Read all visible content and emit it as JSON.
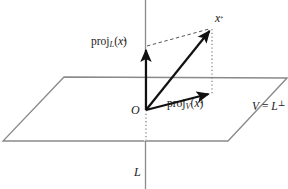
{
  "figure": {
    "width": 288,
    "height": 189,
    "background_color": "#ffffff"
  },
  "labels": {
    "proj_l": {
      "func": "proj",
      "subscript": "L",
      "open": "(",
      "arg": "x",
      "close": ")",
      "text": "proj_L(x⃗)"
    },
    "proj_v": {
      "func": "proj",
      "subscript": "V",
      "open": "(",
      "arg": "x",
      "close": ")",
      "text": "proj_V(x⃗)"
    },
    "x_vector": {
      "arg": "x",
      "text": "x⃗"
    },
    "origin": {
      "text": "O"
    },
    "line_l": {
      "text": "L"
    },
    "plane_v": {
      "lhs": "V",
      "eq": " = ",
      "base": "L",
      "superscript": "⊥",
      "text": "V = L⊥"
    }
  },
  "geometry": {
    "plane": {
      "name": "V = L perp",
      "corner_top_left": [
        64,
        77
      ],
      "corner_top_right": [
        287,
        78
      ],
      "corner_bottom_right": [
        228,
        141
      ],
      "corner_bottom_left": [
        3,
        141
      ],
      "stroke_color": "#8a8a8a",
      "stroke_width": 1.3
    },
    "axis_line_l": {
      "name": "L",
      "x": 145.5,
      "y_top": 0,
      "y_bottom": 189,
      "stroke_color": "#8a8a8a",
      "stroke_width": 1.3
    },
    "origin_point": [
      146,
      110
    ],
    "x_tip": [
      212,
      28
    ],
    "proj_l_tip": [
      146,
      46
    ],
    "proj_v_tip": [
      212,
      93
    ],
    "vectors": [
      {
        "name": "x",
        "from": [
          146,
          110
        ],
        "to": [
          212,
          28
        ],
        "style": "solid",
        "color": "#111111",
        "width": 2.2
      },
      {
        "name": "proj_L(x)",
        "from": [
          146,
          110
        ],
        "to": [
          146,
          46
        ],
        "style": "solid",
        "color": "#111111",
        "width": 2.2
      },
      {
        "name": "proj_V(x)",
        "from": [
          146,
          110
        ],
        "to": [
          212,
          93
        ],
        "style": "solid",
        "color": "#111111",
        "width": 2.2
      }
    ],
    "guides": [
      {
        "name": "dashed-top-parallelogram-edge",
        "from": [
          146,
          46
        ],
        "to": [
          212,
          28
        ],
        "style": "dashed",
        "color": "#555555",
        "width": 1.0
      },
      {
        "name": "dotted-drop-from-x",
        "from": [
          212,
          28
        ],
        "to": [
          212,
          93
        ],
        "style": "dotted",
        "color": "#777777",
        "width": 1.1
      },
      {
        "name": "dotted-axis-below-origin",
        "from": [
          146,
          110
        ],
        "to": [
          146,
          141
        ],
        "style": "dotted",
        "color": "#777777",
        "width": 1.1
      }
    ]
  },
  "colors": {
    "vector_stroke": "#111111",
    "plane_stroke": "#8a8a8a",
    "guide_dashed": "#555555",
    "guide_dotted": "#777777",
    "text": "#1a1a1a"
  }
}
